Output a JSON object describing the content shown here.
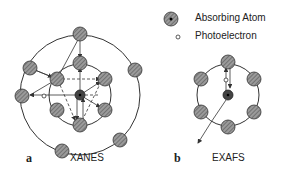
{
  "legend": {
    "absorbing_atom": "Absorbing Atom",
    "photoelectron": "Photoelectron"
  },
  "panels": [
    {
      "letter": "a",
      "title": "XANES"
    },
    {
      "letter": "b",
      "title": "EXAFS"
    }
  ],
  "colors": {
    "atom_fill": "#8a8a8a",
    "absorber_fill": "#444444",
    "line": "#333333"
  }
}
